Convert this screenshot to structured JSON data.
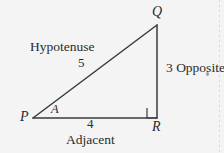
{
  "figure": {
    "background_color": "#f4f4f4",
    "stroke_color": "#3a3a3a",
    "vertices": {
      "P": {
        "label": "P",
        "x": 33,
        "y": 118
      },
      "Q": {
        "label": "Q",
        "x": 157,
        "y": 25
      },
      "R": {
        "label": "R",
        "x": 157,
        "y": 118
      }
    },
    "angle": {
      "label": "A",
      "at_vertex": "P"
    },
    "right_angle": {
      "at_vertex": "R",
      "marker": "square",
      "size": 10
    },
    "sides": [
      {
        "name": "hypotenuse",
        "word": "Hypotenuse",
        "length": "5",
        "from": "P",
        "to": "Q"
      },
      {
        "name": "opposite",
        "word": "Opposite",
        "length": "3",
        "combined": "3 Opposite",
        "from": "Q",
        "to": "R"
      },
      {
        "name": "adjacent",
        "word": "Adjacent",
        "length": "4",
        "from": "P",
        "to": "R"
      }
    ]
  }
}
